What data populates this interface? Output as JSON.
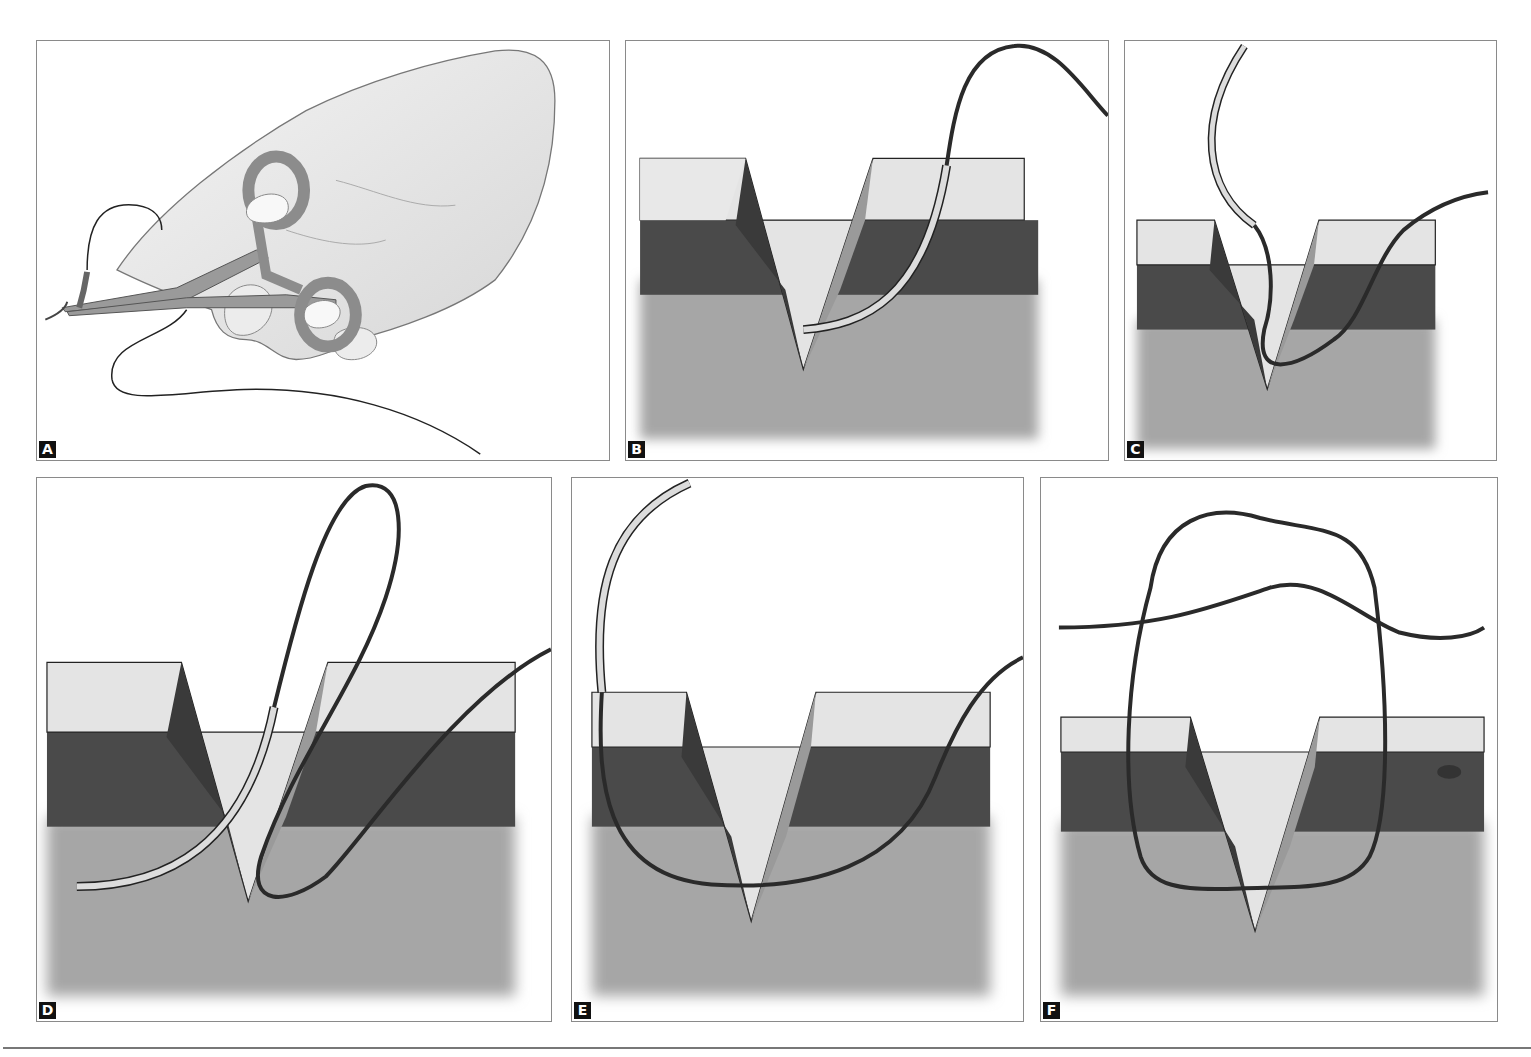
{
  "figure": {
    "panels": [
      {
        "id": "A",
        "label": "A",
        "description": "Hand holding needle driver with curved needle and suture"
      },
      {
        "id": "B",
        "label": "B",
        "description": "Needle entering skin edge perpendicular to wound"
      },
      {
        "id": "C",
        "label": "C",
        "description": "Needle exiting opposite wound edge"
      },
      {
        "id": "D",
        "label": "D",
        "description": "Suture loop pulled through both edges"
      },
      {
        "id": "E",
        "label": "E",
        "description": "Suture drawn across wound base"
      },
      {
        "id": "F",
        "label": "F",
        "description": "Knot tied approximating wound edges"
      }
    ]
  },
  "colors": {
    "epidermis": "#e4e4e4",
    "dermis": "#4a4a4a",
    "subcutis": "#a6a6a6",
    "suture": "#2a2a2a",
    "needle": "#d8d8d8",
    "border": "#8a8a8a",
    "label_bg": "#111111"
  }
}
